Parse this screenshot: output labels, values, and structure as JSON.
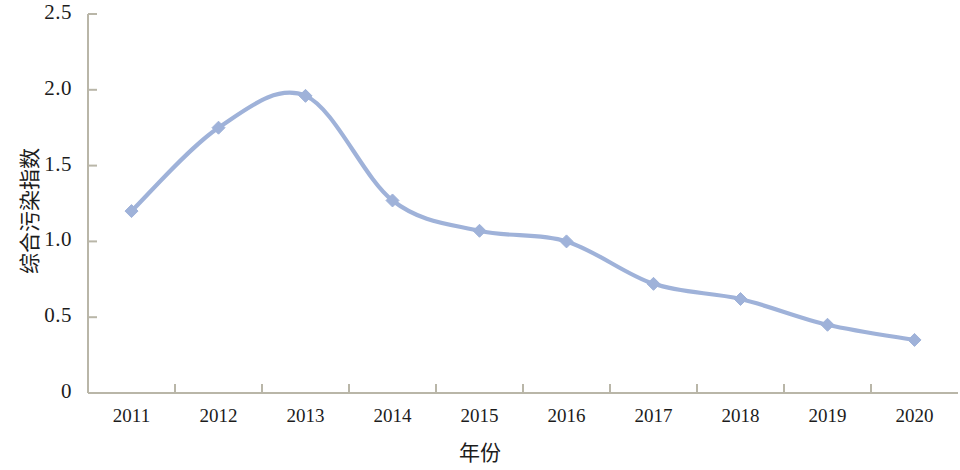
{
  "chart_data": {
    "type": "line",
    "title": "",
    "subtitle": "",
    "xlabel": "年份",
    "ylabel": "综合污染指数",
    "categories": [
      "2011",
      "2012",
      "2013",
      "2014",
      "2015",
      "2016",
      "2017",
      "2018",
      "2019",
      "2020"
    ],
    "x": [
      2011,
      2012,
      2013,
      2014,
      2015,
      2016,
      2017,
      2018,
      2019,
      2020
    ],
    "values": [
      1.2,
      1.75,
      1.96,
      1.27,
      1.07,
      1.0,
      0.72,
      0.62,
      0.45,
      0.35
    ],
    "series": [
      {
        "name": "综合污染指数",
        "values": [
          1.2,
          1.75,
          1.96,
          1.27,
          1.07,
          1.0,
          0.72,
          0.62,
          0.45,
          0.35
        ],
        "color": "#9FB2D9",
        "marker": "diamond",
        "smooth": true
      }
    ],
    "ylim": [
      0,
      2.5
    ],
    "ytick_labels": [
      "0",
      "0.5",
      "1.0",
      "1.5",
      "2.0",
      "2.5"
    ],
    "ytick_values": [
      0,
      0.5,
      1.0,
      1.5,
      2.0,
      2.5
    ],
    "xtick_labels": [
      "2011",
      "2012",
      "2013",
      "2014",
      "2015",
      "2016",
      "2017",
      "2018",
      "2019",
      "2020"
    ],
    "grid": false,
    "legend": false,
    "legend_position": "none",
    "axis_color": "#b9b6a8",
    "text_color": "#1c1c1c",
    "background": "#ffffff"
  }
}
